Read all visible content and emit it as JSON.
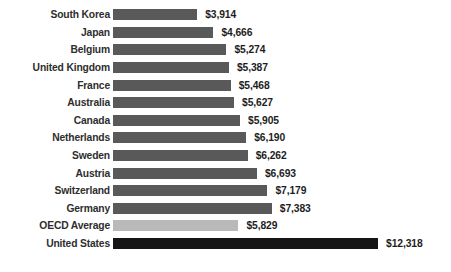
{
  "chart_data": {
    "type": "bar",
    "orientation": "horizontal",
    "title": "",
    "subtitle": "",
    "xlabel": "",
    "ylabel": "",
    "grid": false,
    "legend": "none",
    "xlim": [
      0,
      12318
    ],
    "value_prefix": "$",
    "categories": [
      "South Korea",
      "Japan",
      "Belgium",
      "United Kingdom",
      "France",
      "Australia",
      "Canada",
      "Netherlands",
      "Sweden",
      "Austria",
      "Switzerland",
      "Germany",
      "OECD Average",
      "United States"
    ],
    "values": [
      3914,
      4666,
      5274,
      5387,
      5468,
      5627,
      5905,
      6190,
      6262,
      6693,
      7179,
      7383,
      5829,
      12318
    ],
    "value_labels": [
      "$3,914",
      "$4,666",
      "$5,274",
      "$5,387",
      "$5,468",
      "$5,627",
      "$5,905",
      "$6,190",
      "$6,262",
      "$6,693",
      "$7,179",
      "$7,383",
      "$5,829",
      "$12,318"
    ],
    "bar_styles": [
      "default",
      "default",
      "default",
      "default",
      "default",
      "default",
      "default",
      "default",
      "default",
      "default",
      "default",
      "default",
      "highlight",
      "emphasis"
    ],
    "colors": {
      "bar_default": "#595959",
      "bar_highlight": "#b9b9b9",
      "bar_emphasis": "#151515",
      "label_text": "#2e2e2e",
      "value_text": "#1d1d1d",
      "background": "#ffffff"
    },
    "rows": [
      {
        "label": "South Korea",
        "value": 3914,
        "value_label": "$3,914",
        "style": "default"
      },
      {
        "label": "Japan",
        "value": 4666,
        "value_label": "$4,666",
        "style": "default"
      },
      {
        "label": "Belgium",
        "value": 5274,
        "value_label": "$5,274",
        "style": "default"
      },
      {
        "label": "United Kingdom",
        "value": 5387,
        "value_label": "$5,387",
        "style": "default"
      },
      {
        "label": "France",
        "value": 5468,
        "value_label": "$5,468",
        "style": "default"
      },
      {
        "label": "Australia",
        "value": 5627,
        "value_label": "$5,627",
        "style": "default"
      },
      {
        "label": "Canada",
        "value": 5905,
        "value_label": "$5,905",
        "style": "default"
      },
      {
        "label": "Netherlands",
        "value": 6190,
        "value_label": "$6,190",
        "style": "default"
      },
      {
        "label": "Sweden",
        "value": 6262,
        "value_label": "$6,262",
        "style": "default"
      },
      {
        "label": "Austria",
        "value": 6693,
        "value_label": "$6,693",
        "style": "default"
      },
      {
        "label": "Switzerland",
        "value": 7179,
        "value_label": "$7,179",
        "style": "default"
      },
      {
        "label": "Germany",
        "value": 7383,
        "value_label": "$7,383",
        "style": "default"
      },
      {
        "label": "OECD Average",
        "value": 5829,
        "value_label": "$5,829",
        "style": "highlight"
      },
      {
        "label": "United States",
        "value": 12318,
        "value_label": "$12,318",
        "style": "emphasis"
      }
    ]
  }
}
